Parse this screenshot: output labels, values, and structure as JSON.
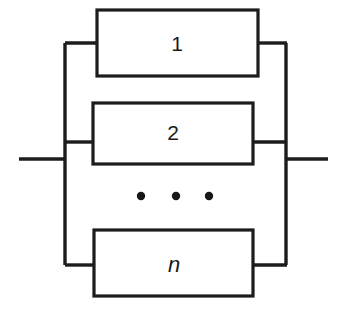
{
  "diagram": {
    "colors": {
      "background": "#ffffff",
      "stroke": "#1c1c1c",
      "label": "#1a1a1a",
      "dot": "#171717"
    },
    "blocks": [
      {
        "id": "block-1",
        "label": "1",
        "italic": false,
        "x": 97,
        "y": 10,
        "width": 161,
        "height": 66,
        "branch_y": 43
      },
      {
        "id": "block-2",
        "label": "2",
        "italic": false,
        "x": 93,
        "y": 103,
        "width": 160,
        "height": 61,
        "branch_y": 142
      },
      {
        "id": "block-n",
        "label": "n",
        "italic": true,
        "x": 94,
        "y": 230,
        "width": 159,
        "height": 66,
        "branch_y": 265
      }
    ],
    "ellipsis": {
      "label": "vertical-continuation-dots",
      "dots": [
        {
          "cx": 141,
          "cy": 196,
          "r": 4.2
        },
        {
          "cx": 176,
          "cy": 196,
          "r": 4.2
        },
        {
          "cx": 209,
          "cy": 196,
          "r": 4.2
        }
      ]
    },
    "bus": {
      "left_x": 65,
      "right_x": 286,
      "top_y": 43,
      "bottom_y": 265
    },
    "leads": {
      "input": {
        "label": "input-terminal",
        "x1": 19,
        "x2": 65,
        "y": 159
      },
      "output": {
        "label": "output-terminal",
        "x1": 286,
        "x2": 328,
        "y": 159
      }
    }
  }
}
